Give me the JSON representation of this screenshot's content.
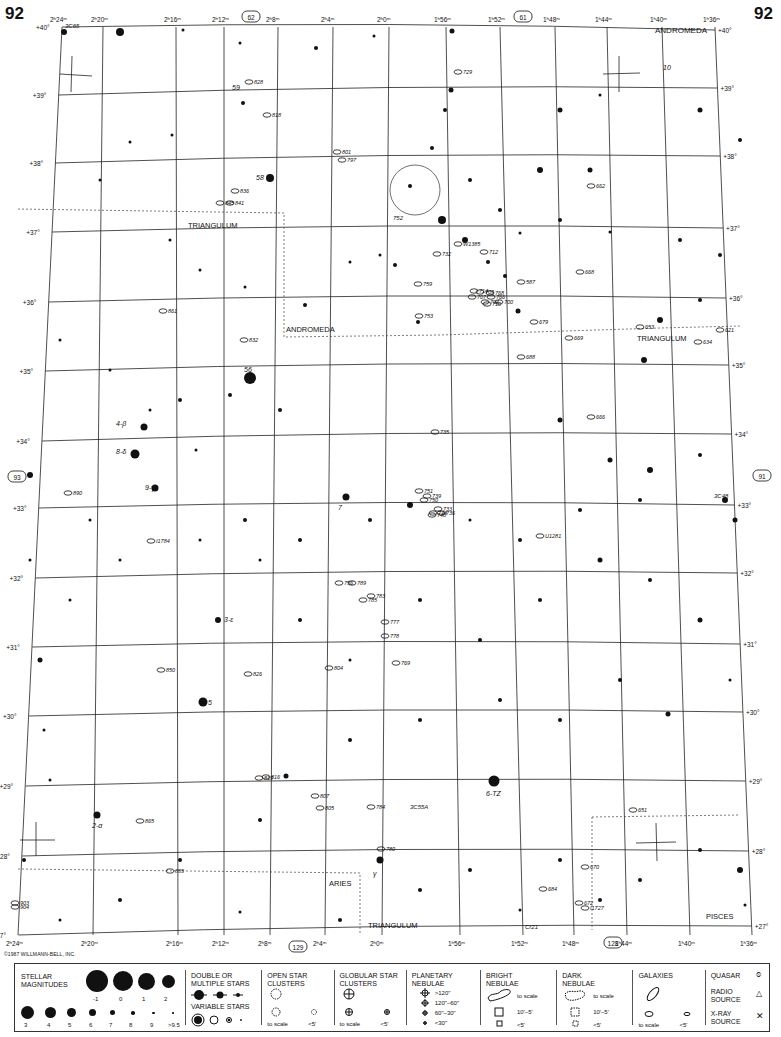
{
  "page": {
    "number_left": "92",
    "number_right": "92",
    "copyright": "©1987 WILLMANN-BELL, INC."
  },
  "adjacent_charts": {
    "top": "62",
    "top_right": "61",
    "left": "93",
    "right": "91",
    "bottom_left": "129",
    "bottom_right": "128"
  },
  "ra_labels_top": [
    "2h24m",
    "2h20m",
    "2h16m",
    "2h12m",
    "2h8m",
    "2h4m",
    "2h0m",
    "1h56m",
    "1h52m",
    "1h48m",
    "1h44m",
    "1h40m",
    "1h36m"
  ],
  "ra_labels_bottom": [
    "2h24m",
    "2h20m",
    "2h16m",
    "2h12m",
    "2h8m",
    "2h4m",
    "2h0m",
    "1h56m",
    "1h52m",
    "1h48m",
    "1h44m",
    "1h40m",
    "1h36m"
  ],
  "dec_labels": [
    "+40°",
    "+39°",
    "+38°",
    "+37°",
    "+36°",
    "+35°",
    "+34°",
    "+33°",
    "+32°",
    "+31°",
    "+30°",
    "+29°",
    "+28°",
    "+27°"
  ],
  "constellations": [
    {
      "name": "ANDROMEDA",
      "where": "top-right"
    },
    {
      "name": "TRIANGULUM",
      "where": "upper-left"
    },
    {
      "name": "ANDROMEDA",
      "where": "center-left"
    },
    {
      "name": "TRIANGULUM",
      "where": "right"
    },
    {
      "name": "ARIES",
      "where": "bottom-center"
    },
    {
      "name": "TRIANGULUM",
      "where": "bottom"
    },
    {
      "name": "PISCES",
      "where": "bottom-right"
    }
  ],
  "star_labels": [
    "59",
    "58",
    "56",
    "4-β",
    "8-δ",
    "9-γ",
    "7",
    "3-ε",
    "5",
    "6-TZ",
    "2-α",
    "10",
    "γ",
    "x"
  ],
  "objects": {
    "galaxies": [
      "828",
      "818",
      "801",
      "797",
      "836",
      "845",
      "841",
      "861",
      "832",
      "729",
      "752",
      "732",
      "W1385",
      "712",
      "759",
      "714",
      "709",
      "768",
      "766",
      "707",
      "704",
      "710",
      "700",
      "587",
      "668",
      "753",
      "679",
      "669",
      "688",
      "653",
      "634",
      "621",
      "662",
      "666",
      "735",
      "751",
      "750",
      "739",
      "733",
      "738",
      "740",
      "736",
      "756",
      "789",
      "783",
      "785",
      "777",
      "778",
      "804",
      "769",
      "850",
      "826",
      "819",
      "816",
      "807",
      "805",
      "784",
      "780",
      "865",
      "855",
      "903",
      "904",
      "684",
      "672",
      "670",
      "651",
      "U1281",
      "I1784",
      "890",
      "I1727"
    ],
    "clusters": [
      "752",
      "Cr21"
    ],
    "quasars": [
      "3C48"
    ],
    "radio_sources": [
      "3C65",
      "3C55A"
    ]
  },
  "legend": {
    "stellar_magnitudes": {
      "title": "STELLAR MAGNITUDES",
      "big": [
        "-1",
        "0",
        "1",
        "2"
      ],
      "small": [
        "3",
        "4",
        "5",
        "6",
        "7",
        "8",
        "9",
        ">9.5"
      ]
    },
    "double_stars": "DOUBLE OR MULTIPLE STARS",
    "variable_stars": "VARIABLE STARS",
    "open_clusters": {
      "title": "OPEN STAR CLUSTERS",
      "to_scale": "to scale",
      "small": "<5'"
    },
    "globular_clusters": {
      "title": "GLOBULAR STAR CLUSTERS",
      "to_scale": "to scale",
      "small": "<5'"
    },
    "planetary_nebulae": {
      "title": "PLANETARY NEBULAE",
      "sizes": [
        ">120\"",
        "120\"–60\"",
        "60\"–30\"",
        "<30\""
      ]
    },
    "bright_nebulae": {
      "title": "BRIGHT NEBULAE",
      "to_scale": "to scale",
      "mid": "10'–5'",
      "small": "<5'"
    },
    "dark_nebulae": {
      "title": "DARK NEBULAE",
      "to_scale": "to scale",
      "mid": "10'–5'",
      "small": "<5'"
    },
    "galaxies": {
      "title": "GALAXIES",
      "to_scale": "to scale",
      "small": "<5'"
    },
    "quasar": "QUASAR",
    "radio_source": "RADIO SOURCE",
    "xray_source": "X-RAY SOURCE"
  }
}
